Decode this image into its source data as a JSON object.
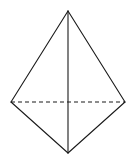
{
  "diagram": {
    "type": "tetrahedron-wireframe",
    "background": "#ffffff",
    "stroke_color": "#1a1a1a",
    "vertices": {
      "top": [
        68,
        11
      ],
      "left": [
        11,
        102
      ],
      "right": [
        125,
        102
      ],
      "bottom": [
        68,
        153
      ]
    },
    "solid_edges": [
      [
        "top",
        "left"
      ],
      [
        "top",
        "right"
      ],
      [
        "top",
        "bottom"
      ],
      [
        "left",
        "bottom"
      ],
      [
        "right",
        "bottom"
      ]
    ],
    "dashed_edges": [
      [
        "left",
        "right"
      ]
    ]
  }
}
